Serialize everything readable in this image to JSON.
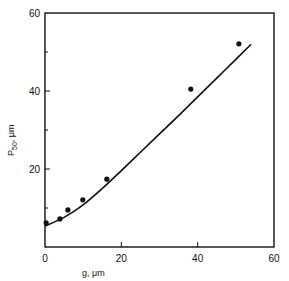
{
  "chart_data": {
    "type": "scatter",
    "title": "",
    "xlabel": "g, μm",
    "ylabel": "P50, μm",
    "ylabel_main": "P",
    "ylabel_sub": "50",
    "ylabel_unit": ", μm",
    "xlim": [
      0,
      60
    ],
    "ylim": [
      0,
      60
    ],
    "xticks": [
      0,
      20,
      40,
      60
    ],
    "yticks": [
      0,
      20,
      40,
      60
    ],
    "xtick_labels": [
      "0",
      "20",
      "40",
      "60"
    ],
    "ytick_labels": [
      "",
      "20",
      "40",
      "60"
    ],
    "minor_yticks": [
      10,
      30,
      50
    ],
    "grid": false,
    "legend": null,
    "series": [
      {
        "name": "measured",
        "kind": "points",
        "x": [
          0.3,
          3.9,
          6.0,
          9.9,
          16.2,
          38.2,
          50.8
        ],
        "y": [
          6.2,
          7.2,
          9.5,
          12.1,
          17.4,
          40.5,
          52.1
        ]
      },
      {
        "name": "fit",
        "kind": "line",
        "x": [
          0,
          5,
          10,
          15,
          20,
          25,
          30,
          35,
          40,
          45,
          50,
          54
        ],
        "y": [
          5.4,
          7.6,
          10.8,
          15.0,
          19.6,
          24.3,
          29.0,
          33.7,
          38.5,
          43.3,
          48.1,
          52.0
        ]
      }
    ]
  },
  "colors": {
    "ink": "#111111",
    "background": "#ffffff"
  }
}
